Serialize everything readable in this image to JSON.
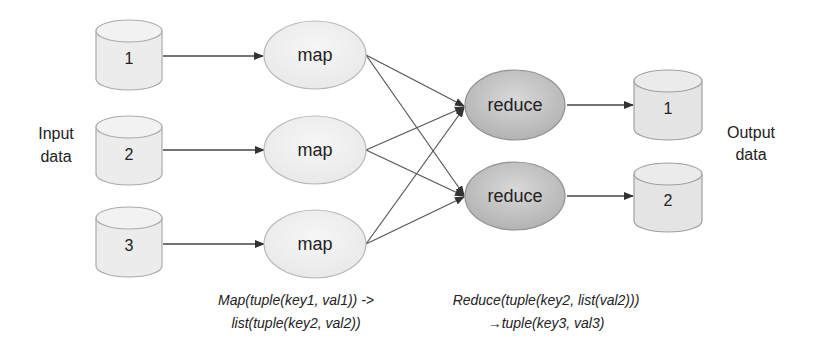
{
  "diagram": {
    "type": "mapreduce-dataflow",
    "input_label": [
      "Input",
      "data"
    ],
    "output_label": [
      "Output",
      "data"
    ],
    "inputs": [
      {
        "id": "in1",
        "label": "1"
      },
      {
        "id": "in2",
        "label": "2"
      },
      {
        "id": "in3",
        "label": "3"
      }
    ],
    "mappers": [
      {
        "id": "map1",
        "label": "map"
      },
      {
        "id": "map2",
        "label": "map"
      },
      {
        "id": "map3",
        "label": "map"
      }
    ],
    "reducers": [
      {
        "id": "red1",
        "label": "reduce"
      },
      {
        "id": "red2",
        "label": "reduce"
      }
    ],
    "outputs": [
      {
        "id": "out1",
        "label": "1"
      },
      {
        "id": "out2",
        "label": "2"
      }
    ],
    "edges": [
      [
        "in1",
        "map1"
      ],
      [
        "in2",
        "map2"
      ],
      [
        "in3",
        "map3"
      ],
      [
        "map1",
        "red1"
      ],
      [
        "map1",
        "red2"
      ],
      [
        "map2",
        "red1"
      ],
      [
        "map2",
        "red2"
      ],
      [
        "map3",
        "red1"
      ],
      [
        "map3",
        "red2"
      ],
      [
        "red1",
        "out1"
      ],
      [
        "red2",
        "out2"
      ]
    ],
    "captions": {
      "map": [
        "Map(tuple(key1, val1)) ->",
        "list(tuple(key2, val2))"
      ],
      "reduce": [
        "Reduce(tuple(key2, list(val2)))",
        "→tuple(key3, val3)"
      ]
    },
    "colors": {
      "cylinder_fill": "#ececec",
      "map_fill": "#eeeeee",
      "reduce_fill": "#c4c4c4",
      "stroke": "#aaaaaa",
      "edge": "#444444"
    }
  }
}
